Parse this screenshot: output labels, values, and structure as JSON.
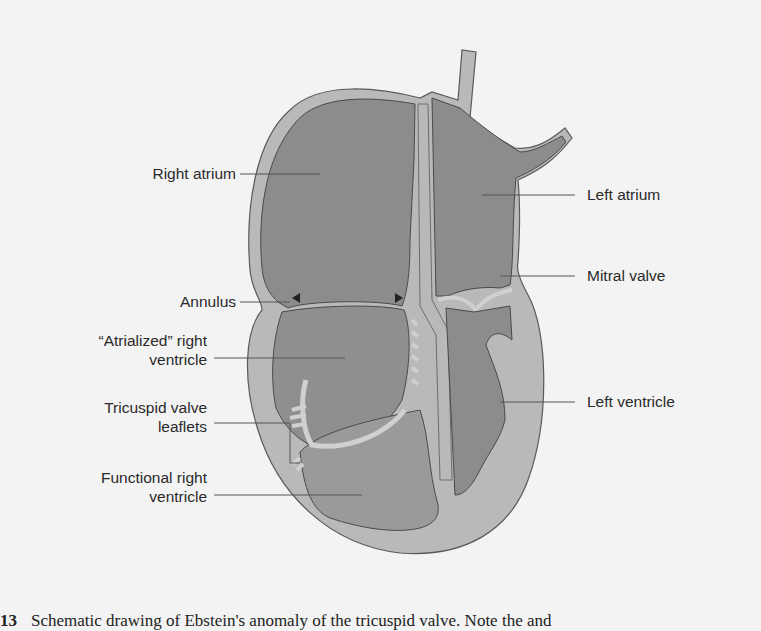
{
  "figure": {
    "title": "Schematic drawing of Ebstein's anomaly of the tricuspid valve",
    "colors": {
      "background": "#f3f3f3",
      "wall": "#b9b9b9",
      "chamber": "#8c8c8c",
      "chamber_light": "#a3a3a3",
      "outline": "#5a5a5a",
      "leader_line": "#555555",
      "text": "#2a2a2a"
    },
    "labels_left": [
      {
        "id": "right-atrium",
        "lines": [
          "Right atrium"
        ]
      },
      {
        "id": "annulus",
        "lines": [
          "Annulus"
        ]
      },
      {
        "id": "atrialized-right-ventricle",
        "lines": [
          "“Atrialized” right",
          "ventricle"
        ]
      },
      {
        "id": "tricuspid-valve-leaflets",
        "lines": [
          "Tricuspid valve",
          "leaflets"
        ]
      },
      {
        "id": "functional-right-ventricle",
        "lines": [
          "Functional right",
          "ventricle"
        ]
      }
    ],
    "labels_right": [
      {
        "id": "left-atrium",
        "lines": [
          "Left atrium"
        ]
      },
      {
        "id": "mitral-valve",
        "lines": [
          "Mitral valve"
        ]
      },
      {
        "id": "left-ventricle",
        "lines": [
          "Left ventricle"
        ]
      }
    ],
    "markers": [
      "annulus-arrowhead-left",
      "annulus-arrowhead-right"
    ]
  },
  "caption": {
    "number": "13",
    "text": "Schematic drawing of Ebstein's anomaly of the tricuspid valve. Note the and"
  }
}
